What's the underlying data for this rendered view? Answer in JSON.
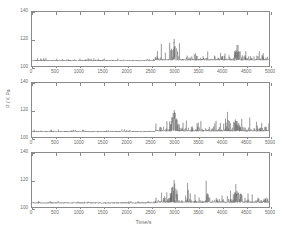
{
  "figure": {
    "axis_title_y": "P / K Pa",
    "axis_title_x": "Time/s"
  },
  "chart_data": {
    "type": "line",
    "title": "",
    "xlabel": "Time/s",
    "ylabel": "P / K Pa",
    "xlim": [
      0,
      5000
    ],
    "ylim": [
      100,
      140
    ],
    "xticks": [
      0,
      500,
      1000,
      1500,
      2000,
      2500,
      3000,
      3500,
      4000,
      4500,
      5000
    ],
    "yticks": [
      100,
      120,
      140
    ],
    "xtick_labels": [
      "0",
      "500",
      "1000",
      "1500",
      "2000",
      "2500",
      "3000",
      "3500",
      "4000",
      "4500",
      "5000"
    ],
    "ytick_labels": [
      "100",
      "120",
      "140"
    ],
    "grid": false,
    "legend": "none",
    "line_color": "#555555",
    "line_width": 0.35,
    "panels": [
      {
        "name": "panel-1",
        "baseline": 104,
        "quiet_region": [
          0,
          2600
        ],
        "active_region": [
          2600,
          5000
        ],
        "max_peak_value": 120,
        "max_peak_time": 3000,
        "series": {
          "name": "pressure-trace-1",
          "x": [
            0,
            100,
            200,
            300,
            400,
            500,
            600,
            700,
            800,
            900,
            1000,
            1100,
            1200,
            1300,
            1400,
            1500,
            1600,
            1700,
            1800,
            1900,
            2000,
            2100,
            2200,
            2300,
            2400,
            2500,
            2600,
            2700,
            2800,
            2900,
            3000,
            3100,
            3200,
            3300,
            3400,
            3500,
            3600,
            3700,
            3800,
            3900,
            4000,
            4100,
            4200,
            4300,
            4400,
            4500,
            4600,
            4700,
            4800,
            4900,
            5000
          ],
          "y": [
            104,
            104,
            104,
            104,
            104,
            104,
            104,
            104,
            105,
            104,
            104,
            105,
            105,
            104,
            104,
            104,
            104,
            104,
            104,
            105,
            105,
            105,
            104,
            104,
            104,
            104,
            105,
            106,
            107,
            108,
            120,
            107,
            108,
            107,
            108,
            110,
            107,
            109,
            107,
            107,
            107,
            107,
            108,
            112,
            110,
            108,
            107,
            107,
            107,
            108,
            107
          ]
        }
      },
      {
        "name": "panel-2",
        "baseline": 104,
        "quiet_region": [
          0,
          2600
        ],
        "active_region": [
          2600,
          5000
        ],
        "max_peak_value": 120,
        "max_peak_time": 3000,
        "series": {
          "name": "pressure-trace-2",
          "x": [
            0,
            100,
            200,
            300,
            400,
            500,
            600,
            700,
            800,
            900,
            1000,
            1100,
            1200,
            1300,
            1400,
            1500,
            1600,
            1700,
            1800,
            1900,
            2000,
            2100,
            2200,
            2300,
            2400,
            2500,
            2600,
            2700,
            2800,
            2900,
            3000,
            3100,
            3200,
            3300,
            3400,
            3500,
            3600,
            3700,
            3800,
            3900,
            4000,
            4100,
            4200,
            4300,
            4400,
            4500,
            4600,
            4700,
            4800,
            4900,
            5000
          ],
          "y": [
            104,
            104,
            104,
            105,
            104,
            104,
            104,
            104,
            104,
            104,
            104,
            105,
            105,
            104,
            104,
            104,
            104,
            105,
            104,
            105,
            105,
            105,
            104,
            104,
            104,
            104,
            105,
            107,
            106,
            108,
            120,
            108,
            107,
            109,
            107,
            110,
            107,
            110,
            107,
            107,
            107,
            108,
            108,
            113,
            109,
            108,
            107,
            108,
            107,
            109,
            107
          ]
        }
      },
      {
        "name": "panel-3",
        "baseline": 103,
        "quiet_region": [
          0,
          2600
        ],
        "active_region": [
          2600,
          5000
        ],
        "max_peak_value": 120,
        "max_peak_time": 3000,
        "series": {
          "name": "pressure-trace-3",
          "x": [
            0,
            100,
            200,
            300,
            400,
            500,
            600,
            700,
            800,
            900,
            1000,
            1100,
            1200,
            1300,
            1400,
            1500,
            1600,
            1700,
            1800,
            1900,
            2000,
            2100,
            2200,
            2300,
            2400,
            2500,
            2600,
            2700,
            2800,
            2900,
            3000,
            3100,
            3200,
            3300,
            3400,
            3500,
            3600,
            3700,
            3800,
            3900,
            4000,
            4100,
            4200,
            4300,
            4400,
            4500,
            4600,
            4700,
            4800,
            4900,
            5000
          ],
          "y": [
            103,
            103,
            104,
            103,
            103,
            103,
            104,
            103,
            104,
            103,
            103,
            104,
            104,
            103,
            103,
            103,
            103,
            104,
            104,
            104,
            104,
            104,
            103,
            103,
            103,
            104,
            104,
            106,
            107,
            108,
            120,
            107,
            108,
            108,
            107,
            109,
            107,
            110,
            107,
            107,
            107,
            108,
            108,
            112,
            110,
            107,
            107,
            108,
            107,
            108,
            107
          ]
        }
      }
    ]
  }
}
